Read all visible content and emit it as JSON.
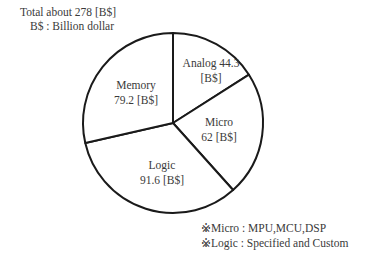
{
  "header": {
    "total": "Total about 278 [B$]",
    "unit": "B$ : Billion dollar"
  },
  "footnotes": [
    "※Micro : MPU,MCU,DSP",
    "※Logic : Specified and Custom"
  ],
  "slice_labels": [
    {
      "line1": "Analog 44.3",
      "line2": "[B$]"
    },
    {
      "line1": "Micro",
      "line2": "62 [B$]"
    },
    {
      "line1": "Logic",
      "line2": "91.6 [B$]"
    },
    {
      "line1": "Memory",
      "line2": "79.2 [B$]"
    }
  ],
  "chart_data": {
    "type": "pie",
    "title": "Total about 278 [B$]",
    "subtitle": "B$ : Billion dollar",
    "categories": [
      "Analog",
      "Micro",
      "Logic",
      "Memory"
    ],
    "values": [
      44.3,
      62,
      91.6,
      79.2
    ],
    "unit": "B$",
    "total": 278,
    "start_angle": "12 o'clock",
    "direction": "clockwise",
    "fill": "#ffffff",
    "stroke": "#1a1a1a",
    "legend": "none (labels inside slices)",
    "annotations": [
      "※Micro : MPU,MCU,DSP",
      "※Logic : Specified and Custom"
    ]
  }
}
